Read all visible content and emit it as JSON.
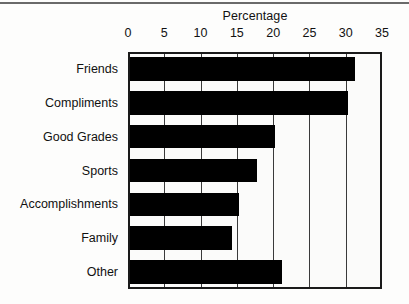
{
  "chart_data": {
    "type": "bar",
    "orientation": "horizontal",
    "title": "Percentage",
    "xlabel": "",
    "ylabel": "",
    "xlim": [
      0,
      35
    ],
    "xticks": [
      0,
      5,
      10,
      15,
      20,
      25,
      30,
      35
    ],
    "xtick_labels": [
      "0",
      "5",
      "10",
      "15",
      "20",
      "25",
      "30",
      "35"
    ],
    "grid": true,
    "grid_axis": "x",
    "legend": false,
    "bar_color": "#000000",
    "frame_color": "#1a1a1a",
    "background": "#fbfbfa",
    "categories": [
      "Friends",
      "Compliments",
      "Good Grades",
      "Sports",
      "Accomplishments",
      "Family",
      "Other"
    ],
    "values": [
      31,
      30,
      20,
      17.5,
      15,
      14,
      21
    ],
    "series": [
      {
        "name": "Percentage",
        "values": [
          31,
          30,
          20,
          17.5,
          15,
          14,
          21
        ]
      }
    ]
  }
}
